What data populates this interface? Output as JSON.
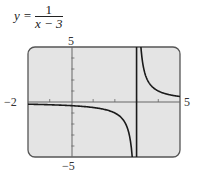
{
  "equation": {
    "lhs": "y =",
    "numerator": "1",
    "denominator": "x − 3"
  },
  "axis_labels": {
    "xmin": "−2",
    "xmax": "5",
    "ymax": "5",
    "ymin": "−5"
  },
  "colors": {
    "plot_bg": "#e4e4e4",
    "frame": "#555555",
    "curve": "#1a1a1a"
  },
  "chart_data": {
    "type": "line",
    "function": "1/(x-3)",
    "xlabel": "",
    "ylabel": "",
    "xlim": [
      -2,
      5
    ],
    "ylim": [
      -5,
      5
    ],
    "x_ticks": [
      -2,
      -1,
      0,
      1,
      2,
      3,
      4,
      5
    ],
    "y_ticks": [
      -5,
      -4,
      -3,
      -2,
      -1,
      0,
      1,
      2,
      3,
      4,
      5
    ],
    "vertical_asymptote": 3,
    "horizontal_asymptote": 0,
    "grid": false,
    "series": [
      {
        "name": "left branch",
        "x": [
          -2,
          -1,
          0,
          1,
          2,
          2.5,
          2.8
        ],
        "y": [
          -0.2,
          -0.25,
          -0.333,
          -0.5,
          -1,
          -2,
          -5
        ]
      },
      {
        "name": "right branch",
        "x": [
          3.2,
          3.5,
          4,
          4.5,
          5
        ],
        "y": [
          5,
          2,
          1,
          0.667,
          0.5
        ]
      }
    ]
  }
}
